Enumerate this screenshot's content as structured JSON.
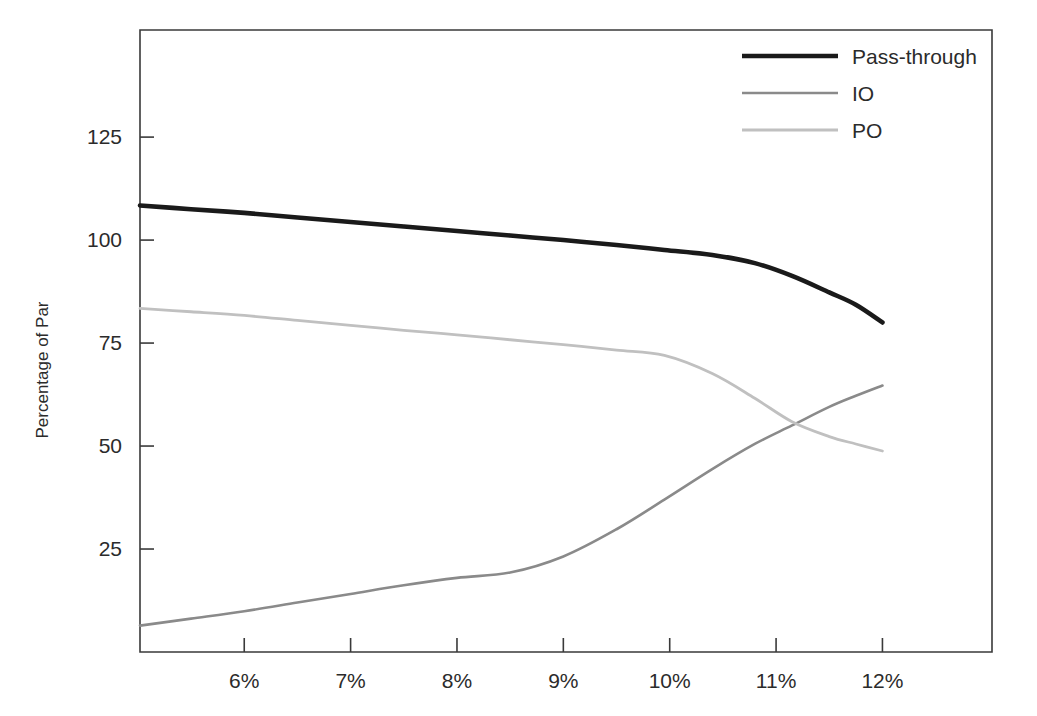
{
  "chart_data": {
    "type": "line",
    "title": "",
    "subtitle": "",
    "xlabel": "",
    "ylabel": "Percentage of Par",
    "grid": false,
    "legend_position": "top-right",
    "xlim": [
      5.02,
      13.03
    ],
    "ylim": [
      0.0,
      151.0
    ],
    "x_tick_labels": [
      "6%",
      "7%",
      "8%",
      "9%",
      "10%",
      "11%",
      "12%"
    ],
    "x_ticks": [
      6,
      7,
      8,
      9,
      10,
      11,
      12
    ],
    "y_tick_labels": [
      "25",
      "50",
      "75",
      "100",
      "125"
    ],
    "y_ticks": [
      25,
      50,
      75,
      100,
      125
    ],
    "x": [
      5.02,
      5.5,
      6.0,
      6.5,
      7.0,
      7.5,
      8.0,
      8.5,
      9.0,
      9.5,
      9.95,
      10.4,
      10.8,
      11.15,
      11.5,
      11.75,
      12.0
    ],
    "series": [
      {
        "name": "Pass-through",
        "color": "#1a1a1a",
        "width": 4.6,
        "values": [
          108.4,
          107.5,
          106.6,
          105.5,
          104.4,
          103.3,
          102.2,
          101.1,
          100.0,
          98.8,
          97.6,
          96.4,
          94.4,
          91.3,
          87.3,
          84.3,
          80.0
        ]
      },
      {
        "name": "IO",
        "color": "#8a8a8a",
        "width": 2.6,
        "values": [
          6.4,
          8.1,
          9.9,
          12.0,
          14.1,
          16.2,
          18.0,
          19.3,
          23.2,
          29.8,
          37.0,
          44.4,
          50.5,
          55.0,
          59.5,
          62.2,
          64.7
        ]
      },
      {
        "name": "PO",
        "color": "#c0c0c0",
        "width": 2.8,
        "values": [
          83.4,
          82.6,
          81.7,
          80.5,
          79.3,
          78.1,
          77.0,
          75.8,
          74.6,
          73.3,
          72.0,
          67.6,
          61.6,
          55.9,
          52.3,
          50.5,
          48.8
        ]
      }
    ],
    "annotations": {
      "io_po_crossover": {
        "x": 11.15,
        "y": 54.6
      }
    }
  },
  "legend": {
    "items": [
      {
        "label": "Pass-through"
      },
      {
        "label": "IO"
      },
      {
        "label": "PO"
      }
    ]
  },
  "axes": {
    "y_title": "Percentage of Par"
  }
}
